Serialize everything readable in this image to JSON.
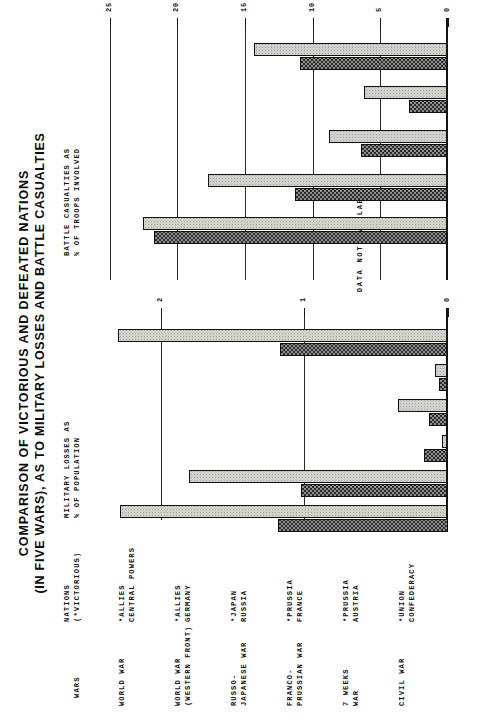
{
  "title": {
    "line1": "COMPARISON OF VICTORIOUS AND DEFEATED NATIONS",
    "line2": "(IN FIVE WARS), AS TO MILITARY LOSSES AND BATTLE CASUALTIES"
  },
  "headers": {
    "wars": "WARS",
    "nations_l1": "NATIONS",
    "nations_l2": "(*VICTORIOUS)",
    "military_l1": "MILITARY LOSSES AS",
    "military_l2": "% OF POPULATION",
    "battle_l1": "BATTLE CASUALTIES AS",
    "battle_l2": "% OF TROOPS INVOLVED"
  },
  "annotations": {
    "data_not_available": "DATA  NOT  AVAILABLE"
  },
  "rows": [
    {
      "war_l1": "WORLD WAR",
      "war_l2": "",
      "victor": "*ALLIES",
      "defeated": "CENTRAL POWERS"
    },
    {
      "war_l1": "WORLD WAR",
      "war_l2": "(WESTERN FRONT)",
      "victor": "*ALLIES",
      "defeated": "GERMANY"
    },
    {
      "war_l1": "RUSSO-",
      "war_l2": "JAPANESE WAR",
      "victor": "*JAPAN",
      "defeated": "RUSSIA"
    },
    {
      "war_l1": "FRANCO-",
      "war_l2": "PRUSSIAN WAR",
      "victor": "*PRUSSIA",
      "defeated": "FRANCE"
    },
    {
      "war_l1": "7 WEEKS",
      "war_l2": "WAR",
      "victor": "*PRUSSIA",
      "defeated": "AUSTRIA"
    },
    {
      "war_l1": "CIVIL WAR",
      "war_l2": "",
      "victor": "*UNION",
      "defeated": "CONFEDERACY"
    }
  ],
  "chart_data": [
    {
      "type": "bar",
      "title": "MILITARY LOSSES AS % OF POPULATION",
      "xlabel": "MILITARY LOSSES AS % OF POPULATION",
      "ylabel": "",
      "orientation": "horizontal-rows",
      "grid": true,
      "xlim": [
        0,
        2.45
      ],
      "ticks": [
        0,
        1,
        2
      ],
      "ticklabels": [
        "0",
        "1",
        "2"
      ],
      "legend_position": "none",
      "categories": [
        "WORLD WAR",
        "WORLD WAR (WESTERN FRONT)",
        "RUSSO-JAPANESE WAR",
        "FRANCO-PRUSSIAN WAR",
        "7 WEEKS WAR",
        "CIVIL WAR"
      ],
      "series": [
        {
          "name": "*VICTORIOUS",
          "values": [
            1.18,
            1.02,
            0.17,
            0.13,
            0.06,
            1.17
          ]
        },
        {
          "name": "DEFEATED",
          "values": [
            2.28,
            1.8,
            0.04,
            0.35,
            0.09,
            2.3
          ]
        }
      ]
    },
    {
      "type": "bar",
      "title": "BATTLE CASUALTIES AS % OF TROOPS INVOLVED",
      "xlabel": "BATTLE CASUALTIES AS % OF TROOPS INVOLVED",
      "ylabel": "",
      "orientation": "horizontal-rows",
      "grid": true,
      "xlim": [
        0,
        26
      ],
      "ticks": [
        0,
        5,
        10,
        15,
        20,
        25
      ],
      "ticklabels": [
        "0",
        "5",
        "10",
        "15",
        "20",
        "25"
      ],
      "legend_position": "none",
      "categories": [
        "WORLD WAR",
        "WORLD WAR (WESTERN FRONT)",
        "RUSSO-JAPANESE WAR",
        "FRANCO-PRUSSIAN WAR",
        "7 WEEKS WAR",
        "CIVIL WAR"
      ],
      "series": [
        {
          "name": "*VICTORIOUS",
          "values": [
            null,
            21.7,
            11.3,
            6.4,
            2.9,
            10.9
          ]
        },
        {
          "name": "DEFEATED",
          "values": [
            null,
            22.5,
            17.7,
            8.8,
            6.2,
            14.3
          ]
        }
      ],
      "missing_note": "DATA  NOT  AVAILABLE"
    }
  ]
}
